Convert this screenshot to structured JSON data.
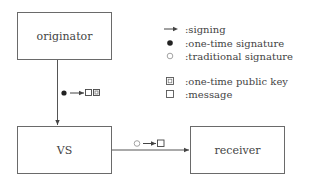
{
  "diagram": {
    "nodes": [
      {
        "id": "originator",
        "label": "originator"
      },
      {
        "id": "vs",
        "label": "VS"
      },
      {
        "id": "receiver",
        "label": "receiver"
      }
    ],
    "edges": [
      {
        "from": "originator",
        "to": "vs",
        "payload": [
          "one-time signature",
          "signing",
          "message",
          "one-time public key"
        ]
      },
      {
        "from": "vs",
        "to": "receiver",
        "payload": [
          "traditional signature",
          "signing",
          "message"
        ]
      }
    ],
    "legend": [
      {
        "symbol": "arrow",
        "label": ":signing"
      },
      {
        "symbol": "filled-circle",
        "label": ":one-time signature"
      },
      {
        "symbol": "open-circle",
        "label": ":traditional signature"
      },
      {
        "symbol": "boxed-square",
        "label": ":one-time public key"
      },
      {
        "symbol": "open-square",
        "label": ":message"
      }
    ],
    "colors": {
      "line": "#555555",
      "box_border": "#6a6a6a",
      "text": "#444444",
      "open_circle": "#999999"
    }
  }
}
